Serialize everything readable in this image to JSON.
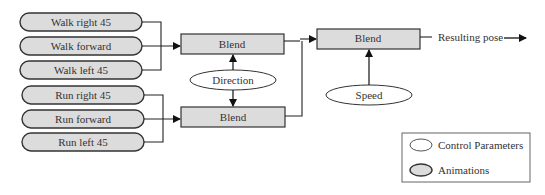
{
  "animations": [
    {
      "label": "Walk right 45"
    },
    {
      "label": "Walk forward"
    },
    {
      "label": "Walk left 45"
    },
    {
      "label": "Run right 45"
    },
    {
      "label": "Run forward"
    },
    {
      "label": "Run left 45"
    }
  ],
  "blend_nodes": [
    {
      "label": "Blend"
    },
    {
      "label": "Blend"
    },
    {
      "label": "Blend"
    }
  ],
  "control_parameters": [
    {
      "label": "Direction"
    },
    {
      "label": "Speed"
    }
  ],
  "output": {
    "label": "Resulting pose"
  },
  "legend": {
    "control_label": "Control Parameters",
    "animation_label": "Animations"
  },
  "colors": {
    "node_fill": "#dcdcdc",
    "stroke": "#333333",
    "background": "#ffffff"
  }
}
